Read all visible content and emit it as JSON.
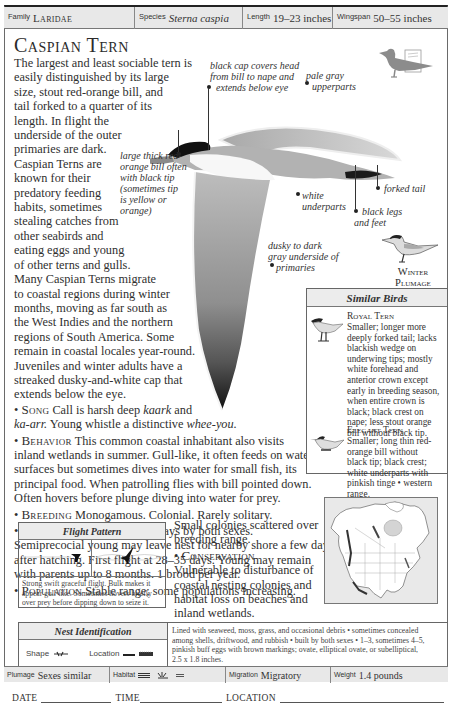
{
  "header": {
    "family": {
      "label": "Family",
      "value": "Laridae"
    },
    "species": {
      "label": "Species",
      "value": "Sterna caspia"
    },
    "length": {
      "label": "Length",
      "value": "19–23 inches"
    },
    "wingspan": {
      "label": "Wingspan",
      "value": "50–55 inches"
    }
  },
  "title": "Caspian Tern",
  "description": {
    "lines": [
      "The largest and least sociable tern is",
      "easily distinguished by its large",
      "size, stout red-orange bill, and",
      "tail forked to a quarter of its",
      "length. In flight the",
      "underside of the outer",
      "primaries are dark.",
      "Caspian Terns are",
      "known for their",
      "predatory feeding",
      "habits, sometimes",
      "stealing catches from",
      "other seabirds and",
      "eating eggs and young",
      "of other terns and gulls.",
      "Many Caspian Terns migrate",
      "to coastal regions during winter",
      "months, moving as far south as",
      "the West Indies and the northern",
      "regions of South America. Some",
      "remain in coastal locales year-round.",
      "Juveniles and winter adults have a",
      "streaked dusky-and-white cap that",
      "extends below the eye."
    ]
  },
  "sections": {
    "song": {
      "heading": "Song",
      "line1_pre": "Call is harsh deep ",
      "line1_em": "kaark",
      "line1_post": " and",
      "line2_em1": "ka-arr.",
      "line2_mid": " Young whistle a distinctive ",
      "line2_em2": "whee-you."
    },
    "behavior": {
      "heading": "Behavior",
      "lines": [
        " This common coastal inhabitant also visits",
        "inland wetlands in summer. Gull-like, it often feeds on water",
        "surfaces but sometimes dives into water for small fish, its",
        "principal food. When patrolling flies with bill pointed down.",
        "Often hovers before plunge diving into water for prey."
      ]
    },
    "breeding": {
      "heading": "Breeding",
      "text": " Monogamous. Colonial. Rarely solitary."
    },
    "nesting": {
      "heading": "Nesting",
      "lines": [
        " Incubation 20–28 days by both sexes.",
        "Semiprecocial young may leave nest for nearby shore a few days",
        "after hatching. First flight at 28–35 days. Young may remain",
        "with parents up to 8 months. 1 brood per year."
      ]
    },
    "population": {
      "heading": "Population",
      "lines": [
        " Stable range; some populations increasing.",
        "Small colonies scattered over",
        "breeding range."
      ]
    },
    "conservation": {
      "heading": "Conservation",
      "lines": [
        "Vulnerable to disturbance of",
        "coastal nesting colonies and",
        "habitat loss on beaches and",
        "inland wetlands."
      ]
    }
  },
  "annotations": {
    "black_cap": [
      "black cap covers head",
      "from bill to nape and",
      "extends below eye"
    ],
    "upperparts": [
      "pale gray",
      "upperparts"
    ],
    "bill": [
      "large thick red-",
      "orange bill often",
      "with black tip",
      "(sometimes tip",
      "is yellow or",
      "orange)"
    ],
    "underparts": [
      "white",
      "underparts"
    ],
    "forked_tail": "forked tail",
    "legs": [
      "black legs",
      "and feet"
    ],
    "primaries": [
      "dusky to dark",
      "gray underside of",
      "primaries"
    ]
  },
  "winter_plumage": [
    "Winter",
    "Plumage"
  ],
  "similar_birds": {
    "title": "Similar Birds",
    "entries": [
      {
        "name": "Royal Tern",
        "lines": [
          "Smaller; longer more",
          "deeply forked tail; lacks",
          "blackish wedge on",
          "underwing tips; mostly",
          "white forehead and",
          "anterior crown except",
          "early in breeding season,",
          "when entire crown is",
          "black; black crest on",
          "nape; less stout orange",
          "bill without black tip."
        ]
      },
      {
        "name": "Elegant Tern",
        "lines": [
          "Smaller; long thin red-",
          "orange bill without",
          "black tip; black crest;",
          "white underparts with",
          "pinkish tinge • western",
          "range."
        ]
      }
    ]
  },
  "flight_pattern": {
    "title": "Flight Pattern",
    "caption": [
      "Strong swift graceful flight. Bulk makes it",
      "appear gull-like. Sometimes hovers briefly",
      "over prey before dipping down to seize it."
    ]
  },
  "nest_identification": {
    "title": "Nest Identification",
    "shape_label": "Shape",
    "location_label": "Location",
    "description": [
      "Lined with seaweed, moss, grass, and occasional debris • sometimes concealed",
      "among shells, driftwood, and rubbish • built by both sexes • 1–3, sometimes 4–5,",
      "pinkish buff eggs with brown markings; ovate, elliptical ovate, or subelliptical,",
      "2.5 x 1.8 inches."
    ]
  },
  "footer": {
    "plumage": {
      "label": "Plumage",
      "value": "Sexes similar"
    },
    "habitat": {
      "label": "Habitat",
      "icons": [
        "shoreline-icon",
        "marsh-icon",
        "lake-icon"
      ]
    },
    "migration": {
      "label": "Migration",
      "value": "Migratory"
    },
    "weight": {
      "label": "Weight",
      "value": "1.4 pounds"
    }
  },
  "log": {
    "date": "DATE",
    "time": "TIME",
    "location": "LOCATION"
  },
  "colors": {
    "bar_bg": "#e8e8e8",
    "border": "#6a6a6a",
    "text": "#2f2f2f",
    "bird_gray": "#8a8a8a",
    "cap_black": "#111111"
  }
}
